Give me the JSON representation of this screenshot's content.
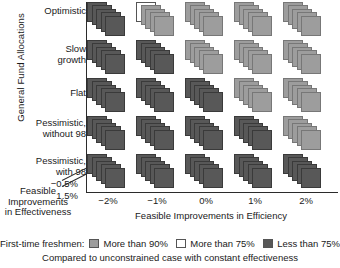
{
  "chart_data": {
    "type": "heatmap",
    "title": "",
    "ylabel": "General Fund Allocations",
    "xlabel": "Feasible Improvements in Efficiency",
    "zlabel": "Feasible Improvements in Effectiveness",
    "grid": false,
    "legend_position": "bottom",
    "row_categories": [
      "Optimistic",
      "Slow\ngrowth",
      "Flat",
      "Pessimistic,\nwithout 98",
      "Pessimistic,\nwith 98"
    ],
    "row_labels_lines": [
      [
        "Optimistic"
      ],
      [
        "Slow",
        "growth"
      ],
      [
        "Flat"
      ],
      [
        "Pessimistic,",
        "without 98"
      ],
      [
        "Pessimistic,",
        "with 98"
      ]
    ],
    "column_categories": [
      "-2%",
      "-1%",
      "0%",
      "1%",
      "2%"
    ],
    "depth_ticks": [
      "−0.5%",
      "1.5%"
    ],
    "categories_note": "Each cell is a cascaded stack of 5 cards, one per depth level of Feasible Improvements in Effectiveness (-0.5% front to 1.5% back).",
    "color_levels": {
      "more_than_90": "#9d9d9d",
      "more_than_75": "#ffffff",
      "less_than_75": "#585858"
    },
    "cells": [
      {
        "row": 0,
        "col": 0,
        "cards": [
          "less_than_75",
          "less_than_75",
          "less_than_75",
          "less_than_75",
          "less_than_75"
        ]
      },
      {
        "row": 0,
        "col": 1,
        "cards": [
          "more_than_75",
          "more_than_90",
          "more_than_90",
          "more_than_90",
          "more_than_90"
        ]
      },
      {
        "row": 0,
        "col": 2,
        "cards": [
          "more_than_90",
          "more_than_90",
          "more_than_90",
          "more_than_90",
          "more_than_90"
        ]
      },
      {
        "row": 0,
        "col": 3,
        "cards": [
          "more_than_90",
          "more_than_90",
          "more_than_90",
          "more_than_90",
          "more_than_90"
        ]
      },
      {
        "row": 0,
        "col": 4,
        "cards": [
          "more_than_90",
          "more_than_90",
          "more_than_90",
          "more_than_90",
          "more_than_90"
        ]
      },
      {
        "row": 1,
        "col": 0,
        "cards": [
          "less_than_75",
          "less_than_75",
          "less_than_75",
          "less_than_75",
          "less_than_75"
        ]
      },
      {
        "row": 1,
        "col": 1,
        "cards": [
          "less_than_75",
          "less_than_75",
          "less_than_75",
          "less_than_75",
          "less_than_75"
        ]
      },
      {
        "row": 1,
        "col": 2,
        "cards": [
          "more_than_90",
          "more_than_90",
          "more_than_90",
          "more_than_90",
          "more_than_90"
        ]
      },
      {
        "row": 1,
        "col": 3,
        "cards": [
          "more_than_90",
          "more_than_90",
          "more_than_90",
          "more_than_90",
          "more_than_90"
        ]
      },
      {
        "row": 1,
        "col": 4,
        "cards": [
          "more_than_90",
          "more_than_90",
          "more_than_90",
          "more_than_90",
          "more_than_90"
        ]
      },
      {
        "row": 2,
        "col": 0,
        "cards": [
          "less_than_75",
          "less_than_75",
          "less_than_75",
          "less_than_75",
          "less_than_75"
        ]
      },
      {
        "row": 2,
        "col": 1,
        "cards": [
          "less_than_75",
          "less_than_75",
          "less_than_75",
          "less_than_75",
          "less_than_75"
        ]
      },
      {
        "row": 2,
        "col": 2,
        "cards": [
          "less_than_75",
          "less_than_75",
          "less_than_75",
          "less_than_75",
          "less_than_75"
        ]
      },
      {
        "row": 2,
        "col": 3,
        "cards": [
          "more_than_90",
          "more_than_90",
          "more_than_90",
          "more_than_90",
          "more_than_90"
        ]
      },
      {
        "row": 2,
        "col": 4,
        "cards": [
          "more_than_90",
          "more_than_90",
          "more_than_90",
          "more_than_90",
          "more_than_90"
        ]
      },
      {
        "row": 3,
        "col": 0,
        "cards": [
          "less_than_75",
          "less_than_75",
          "less_than_75",
          "less_than_75",
          "less_than_75"
        ]
      },
      {
        "row": 3,
        "col": 1,
        "cards": [
          "less_than_75",
          "less_than_75",
          "less_than_75",
          "less_than_75",
          "less_than_75"
        ]
      },
      {
        "row": 3,
        "col": 2,
        "cards": [
          "less_than_75",
          "less_than_75",
          "less_than_75",
          "less_than_75",
          "less_than_75"
        ]
      },
      {
        "row": 3,
        "col": 3,
        "cards": [
          "less_than_75",
          "less_than_75",
          "less_than_75",
          "less_than_75",
          "less_than_75"
        ]
      },
      {
        "row": 3,
        "col": 4,
        "cards": [
          "more_than_90",
          "more_than_90",
          "more_than_90",
          "more_than_90",
          "more_than_90"
        ]
      },
      {
        "row": 4,
        "col": 0,
        "cards": [
          "less_than_75",
          "less_than_75",
          "less_than_75",
          "less_than_75",
          "less_than_75"
        ]
      },
      {
        "row": 4,
        "col": 1,
        "cards": [
          "less_than_75",
          "less_than_75",
          "less_than_75",
          "less_than_75",
          "less_than_75"
        ]
      },
      {
        "row": 4,
        "col": 2,
        "cards": [
          "less_than_75",
          "less_than_75",
          "less_than_75",
          "less_than_75",
          "less_than_75"
        ]
      },
      {
        "row": 4,
        "col": 3,
        "cards": [
          "less_than_75",
          "less_than_75",
          "less_than_75",
          "less_than_75",
          "less_than_75"
        ]
      },
      {
        "row": 4,
        "col": 4,
        "cards": [
          "less_than_75",
          "less_than_75",
          "less_than_75",
          "less_than_75",
          "less_than_75"
        ]
      }
    ]
  },
  "axes": {
    "y_title": "General Fund Allocations",
    "x_title": "Feasible Improvements in Efficiency",
    "depth_title_lines": [
      "Feasible",
      "Improvements",
      "in Effectiveness"
    ],
    "depth_tick_top": "−0.5%",
    "depth_tick_bottom": "1.5%",
    "x_ticks": [
      "−2%",
      "−1%",
      "0%",
      "1%",
      "2%"
    ],
    "row_labels": [
      {
        "lines": [
          "Optimistic"
        ]
      },
      {
        "lines": [
          "Slow",
          "growth"
        ]
      },
      {
        "lines": [
          "Flat"
        ]
      },
      {
        "lines": [
          "Pessimistic,",
          "without 98"
        ]
      },
      {
        "lines": [
          "Pessimistic,",
          "with 98"
        ]
      }
    ]
  },
  "legend": {
    "title": "First-time freshmen:",
    "items": [
      {
        "label": "More than 90%",
        "color": "#9d9d9d"
      },
      {
        "label": "More than 75%",
        "color": "#ffffff"
      },
      {
        "label": "Less than 75%",
        "color": "#585858"
      }
    ],
    "note": "Compared to unconstrained case with constant effectiveness"
  }
}
